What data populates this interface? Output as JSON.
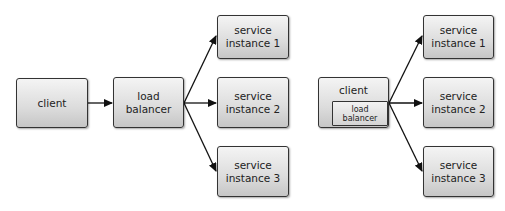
{
  "diagram": {
    "left": {
      "title": "server-side load balancing",
      "client": {
        "label": "client"
      },
      "load_balancer": {
        "label": "load\nbalancer"
      },
      "services": [
        {
          "label": "service\ninstance 1"
        },
        {
          "label": "service\ninstance 2"
        },
        {
          "label": "service\ninstance 3"
        }
      ]
    },
    "right": {
      "title": "client-side load balancing",
      "client": {
        "label": "client"
      },
      "load_balancer": {
        "label": "load\nbalancer"
      },
      "services": [
        {
          "label": "service\ninstance 1"
        },
        {
          "label": "service\ninstance 2"
        },
        {
          "label": "service\ninstance 3"
        }
      ]
    },
    "edges": [
      {
        "from": "left.client",
        "to": "left.load_balancer"
      },
      {
        "from": "left.load_balancer",
        "to": "left.services.0"
      },
      {
        "from": "left.load_balancer",
        "to": "left.services.1"
      },
      {
        "from": "left.load_balancer",
        "to": "left.services.2"
      },
      {
        "from": "right.client.load_balancer",
        "to": "right.services.0"
      },
      {
        "from": "right.client.load_balancer",
        "to": "right.services.1"
      },
      {
        "from": "right.client.load_balancer",
        "to": "right.services.2"
      }
    ],
    "colors": {
      "box_border": "#333333",
      "box_fill_top": "#f4f4f4",
      "box_fill_bottom": "#c6c6c6",
      "arrow": "#111111",
      "background": "#ffffff"
    }
  }
}
